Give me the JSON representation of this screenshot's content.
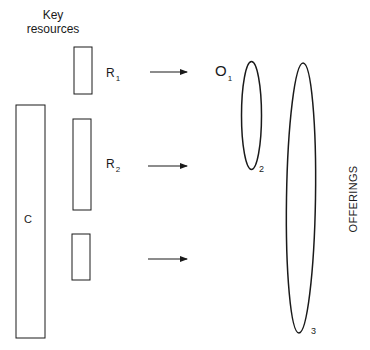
{
  "header": {
    "line1": "Key",
    "line2": "resources"
  },
  "resources": [
    {
      "id": "R1",
      "label": "R",
      "subscript": "1"
    },
    {
      "id": "R2",
      "label": "R",
      "subscript": "2"
    },
    {
      "id": "R3",
      "label": "",
      "subscript": ""
    }
  ],
  "core": {
    "label": "C"
  },
  "offerings": {
    "title": "OFFERINGS",
    "items": [
      {
        "label": "O",
        "subscript": "1"
      },
      {
        "label": "2"
      },
      {
        "label": "3"
      }
    ]
  },
  "colors": {
    "stroke": "#1a1a1a",
    "background": "#ffffff"
  }
}
